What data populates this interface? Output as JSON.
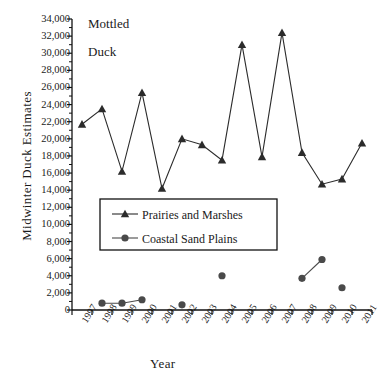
{
  "chart_data": {
    "type": "line",
    "title": "",
    "annotations": [
      "Mottled",
      "Duck"
    ],
    "xlabel": "Year",
    "ylabel": "Midwinter Duck Estimates",
    "categories": [
      "1997",
      "1998",
      "1999",
      "2000",
      "2001",
      "2002",
      "2003",
      "2004",
      "2005",
      "2006",
      "2007",
      "2008",
      "2009",
      "2010",
      "2011"
    ],
    "ylim": [
      0,
      34000
    ],
    "ytick_step": 2000,
    "ytick_labels": [
      "0",
      "2,000",
      "4,000",
      "6,000",
      "8,000",
      "10,000",
      "12,000",
      "14,000",
      "16,000",
      "18,000",
      "20,000",
      "22,000",
      "24,000",
      "26,000",
      "28,000",
      "30,000",
      "32,000",
      "34,000"
    ],
    "ytick_values": [
      0,
      2000,
      4000,
      6000,
      8000,
      10000,
      12000,
      14000,
      16000,
      18000,
      20000,
      22000,
      24000,
      26000,
      28000,
      30000,
      32000,
      34000
    ],
    "grid": false,
    "legend_position": "center-left",
    "series": [
      {
        "name": "Prairies and Marshes",
        "marker": "triangle",
        "color": "#2b2b2b",
        "x": [
          "1997",
          "1998",
          "1999",
          "2000",
          "2001",
          "2002",
          "2003",
          "2004",
          "2005",
          "2006",
          "2007",
          "2008",
          "2009",
          "2010",
          "2011"
        ],
        "values": [
          21700,
          23500,
          16200,
          25400,
          14200,
          20000,
          19300,
          17500,
          31000,
          17900,
          32400,
          18400,
          14700,
          15300,
          19500
        ]
      },
      {
        "name": "Coastal Sand Plains",
        "marker": "circle",
        "color": "#4a4a4a",
        "x": [
          "1998",
          "1999",
          "2000",
          "2002",
          "2004",
          "2008",
          "2009",
          "2010"
        ],
        "values": [
          800,
          800,
          1200,
          600,
          4000,
          3700,
          5900,
          2600
        ],
        "segments": [
          [
            "1998",
            "1999",
            "2000"
          ],
          [
            "2002"
          ],
          [
            "2004"
          ],
          [
            "2008",
            "2009"
          ],
          [
            "2010"
          ]
        ]
      }
    ]
  },
  "legend": {
    "entries": [
      {
        "label": "Prairies and Marshes",
        "marker": "triangle"
      },
      {
        "label": "Coastal Sand Plains",
        "marker": "circle"
      }
    ]
  }
}
